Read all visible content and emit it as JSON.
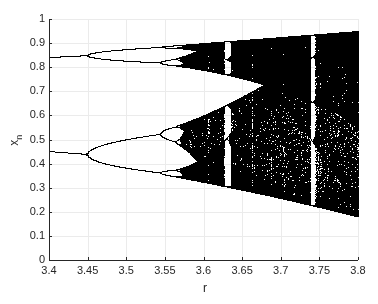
{
  "chart_data": {
    "type": "scatter",
    "title": "",
    "xlabel": "r",
    "ylabel": "x",
    "ylabel_subscript": "n",
    "xlim": [
      3.4,
      3.8
    ],
    "ylim": [
      0,
      1
    ],
    "xticks": [
      "3.4",
      "3.45",
      "3.5",
      "3.55",
      "3.6",
      "3.65",
      "3.7",
      "3.75",
      "3.8"
    ],
    "yticks": [
      "0",
      "0.1",
      "0.2",
      "0.3",
      "0.4",
      "0.5",
      "0.6",
      "0.7",
      "0.8",
      "0.9",
      "1"
    ],
    "grid": true,
    "legend": null,
    "marker_color": "#000000",
    "features": {
      "period2_branches_at_r3.4": [
        0.452,
        0.842
      ],
      "period4_bifurcation_r": 3.449,
      "period8_bifurcation_r": 3.544,
      "onset_of_chaos_r": 3.5699,
      "period3_window_r": [
        3.628,
        3.634
      ],
      "period5_window_r": [
        3.738,
        3.745
      ],
      "chaotic_band_range_at_r3.8": [
        0.18,
        0.95
      ]
    },
    "simulation": {
      "r_min": 3.4,
      "r_max": 3.8,
      "x0": 0.5,
      "transient_iterations": 400,
      "plotted_iterations": 250
    }
  },
  "axes": {
    "plot_left_px": 49,
    "plot_right_px": 358,
    "plot_top_px": 19,
    "plot_bottom_px": 260,
    "grid_color": "#ebebeb",
    "axis_color": "#262626"
  }
}
